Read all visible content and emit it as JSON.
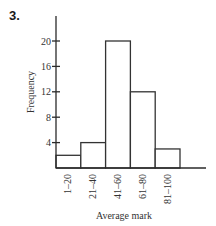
{
  "question_number": "3.",
  "chart_data": {
    "type": "bar",
    "subtype": "histogram",
    "title": "",
    "xlabel": "Average mark",
    "ylabel": "Frequency",
    "categories": [
      "1–20",
      "21–40",
      "41–60",
      "61–80",
      "81–100"
    ],
    "values": [
      2,
      4,
      20,
      12,
      3
    ],
    "ylim": [
      0,
      24
    ],
    "yticks": [
      4,
      8,
      12,
      16,
      20
    ],
    "ytick_labels": [
      "4",
      "8",
      "12",
      "16",
      "20"
    ],
    "grid": false,
    "legend": null
  }
}
